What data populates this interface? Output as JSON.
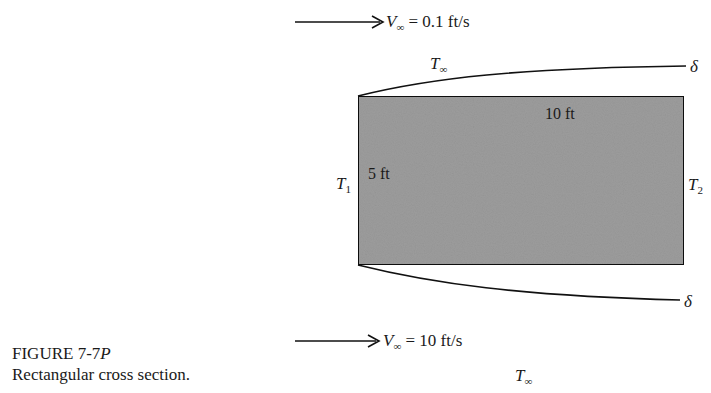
{
  "figure": {
    "label_prefix": "FIGURE 7-7",
    "label_suffix": "P",
    "caption": "Rectangular cross section."
  },
  "top_flow": {
    "velocity_symbol": "V",
    "velocity_sub": "∞",
    "velocity_value": " = 0.1 ft/s",
    "temperature_symbol": "T",
    "temperature_sub": "∞",
    "boundary_layer_label": "δ"
  },
  "bottom_flow": {
    "velocity_symbol": "V",
    "velocity_sub": "∞",
    "velocity_value": " = 10 ft/s",
    "temperature_symbol": "T",
    "temperature_sub": "∞",
    "boundary_layer_label": "δ"
  },
  "body": {
    "width_label": "10 ft",
    "height_label": "5 ft",
    "left_temp_symbol": "T",
    "left_temp_sub": "1",
    "right_temp_symbol": "T",
    "right_temp_sub": "2",
    "fill_color": "#9c9c9c",
    "edge_color": "#111111"
  }
}
